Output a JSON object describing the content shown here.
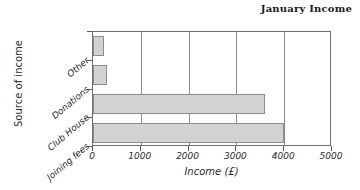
{
  "chart_data": {
    "type": "bar",
    "orientation": "horizontal",
    "title": "January Income",
    "xlabel": "Income (£)",
    "ylabel": "Source of income",
    "categories": [
      "Joining fees",
      "Club House",
      "Donations",
      "Other"
    ],
    "values": [
      4000,
      3600,
      290,
      230
    ],
    "xlim": [
      0,
      5000
    ],
    "xticks": [
      0,
      1000,
      2000,
      3000,
      4000,
      5000
    ],
    "xticklabels": [
      "0",
      "1000",
      "2000",
      "3000",
      "4000",
      "5000"
    ],
    "grid": "vertical",
    "legend": "none",
    "bar_fill": "#d2d2d2",
    "bar_edge": "#8d8d8d",
    "axis_color": "#6e6e6e"
  },
  "categories_top_to_bottom": [
    {
      "label": "Other",
      "value": 230
    },
    {
      "label": "Donations",
      "value": 290
    },
    {
      "label": "Club House",
      "value": 3600
    },
    {
      "label": "Joining fees",
      "value": 4000
    }
  ]
}
